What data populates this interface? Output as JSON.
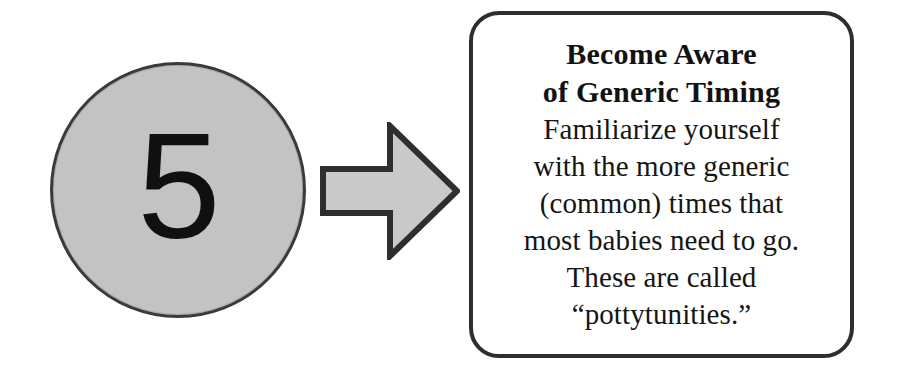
{
  "diagram": {
    "type": "step-callout",
    "step": {
      "number": "5",
      "shape": "circle",
      "fill_color": "#c3c3c3",
      "border_color": "#3a3a3a"
    },
    "arrow": {
      "icon": "right-arrow-icon",
      "direction": "right",
      "fill_color": "#c9c9c9",
      "border_color": "#2e2e2e"
    },
    "callout": {
      "border_color": "#2e2e2e",
      "background_color": "#ffffff",
      "title_lines": [
        "Become Aware",
        "of Generic Timing"
      ],
      "body_lines": [
        "Familiarize yourself",
        "with the more generic",
        "(common) times that",
        "most babies need to go.",
        "These are called",
        "“pottytunities.”"
      ]
    }
  }
}
